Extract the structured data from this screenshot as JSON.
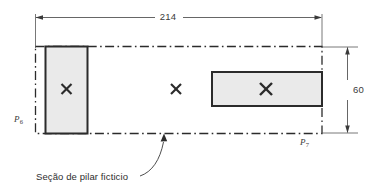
{
  "figure": {
    "type": "engineering-drawing",
    "colors": {
      "line": "#2b2b2b",
      "fill": "#e9e9e9",
      "text": "#333333",
      "background": "#ffffff"
    },
    "dimensions": {
      "overall_length": {
        "value": "214",
        "orientation": "horizontal",
        "position": "top"
      },
      "overall_depth": {
        "value": "60",
        "orientation": "vertical",
        "position": "right"
      }
    },
    "nodes": [
      {
        "id": "p6",
        "symbol": "P",
        "subscript": "6",
        "position": "bottom-left"
      },
      {
        "id": "p7",
        "symbol": "P",
        "subscript": "7",
        "position": "bottom-right"
      }
    ],
    "markers": [
      {
        "id": "marker-left",
        "glyph": "✕",
        "inside": "shaded-rect-left"
      },
      {
        "id": "marker-middle",
        "glyph": "✕",
        "inside": "fictitious-pillar-section"
      },
      {
        "id": "marker-right",
        "glyph": "✕",
        "inside": "shaded-rect-right"
      }
    ],
    "shapes": {
      "outline": {
        "style": "dash-dot",
        "label": "fictitious pillar boundary"
      },
      "rect_left": {
        "style": "solid-filled",
        "orientation": "vertical"
      },
      "rect_right": {
        "style": "solid-filled",
        "orientation": "horizontal"
      }
    },
    "annotation": {
      "text": "Seção de pilar ficticio",
      "leader": "curved-arrow-to-bottom-edge"
    }
  }
}
